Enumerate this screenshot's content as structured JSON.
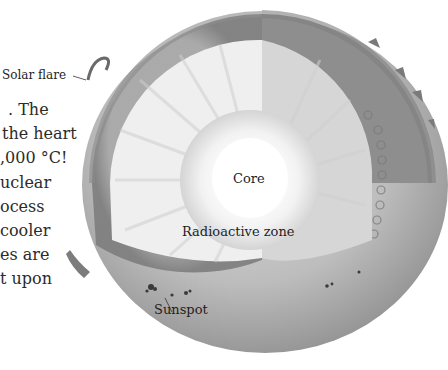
{
  "figure": {
    "labels": {
      "solar_flare": "Solar flare",
      "core": "Core",
      "radiative_zone": "Radioactive zone",
      "sunspot": "Sunspot"
    }
  },
  "body_text": {
    "lines": [
      ". The",
      "the heart",
      ",000 °C!",
      "uclear",
      "ocess",
      " cooler",
      "es are",
      "t upon"
    ]
  },
  "colors": {
    "background": "#ffffff",
    "core": "#ffffff",
    "radiative_zone": "#ececec",
    "convective_zone": "#9a9a9a",
    "photosphere": "#b5b5b5",
    "text": "#2b2b2b"
  }
}
